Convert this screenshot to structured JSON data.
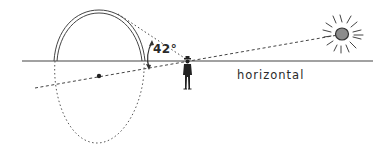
{
  "diagram": {
    "labels": {
      "angle": "42°",
      "horizon": "horizontal"
    },
    "elements": [
      {
        "id": "horizon-line",
        "type": "line",
        "description": "horizontal ground line"
      },
      {
        "id": "rainbow-arc",
        "type": "double-arc",
        "description": "visible rainbow above horizon"
      },
      {
        "id": "hidden-circle",
        "type": "dotted-ellipse",
        "description": "continuation of rainbow circle below horizon"
      },
      {
        "id": "antisolar-point",
        "type": "dot",
        "description": "center of rainbow circle"
      },
      {
        "id": "sun-ray-line",
        "type": "dashed-line",
        "description": "line from sun through observer to antisolar point"
      },
      {
        "id": "view-line",
        "type": "dashed-line",
        "description": "line of sight from observer to top of rainbow"
      },
      {
        "id": "angle-arc",
        "type": "arc-arrow",
        "description": "42 degree angle indicator"
      },
      {
        "id": "observer",
        "type": "figure",
        "description": "person standing on horizon"
      },
      {
        "id": "sun",
        "type": "circle-with-rays",
        "description": "sun"
      }
    ],
    "colors": {
      "stroke": "#3a3a3a",
      "sun_fill": "#8c8c8c",
      "background": "#ffffff"
    }
  }
}
